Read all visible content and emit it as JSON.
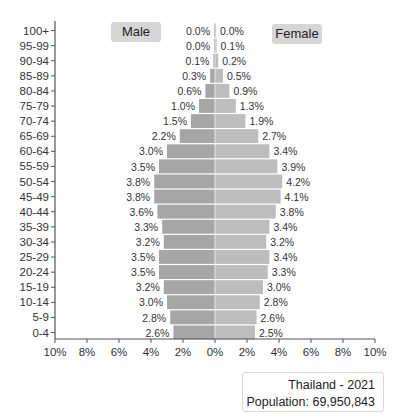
{
  "chart_data": {
    "type": "bar",
    "subtype": "population-pyramid",
    "title": "Thailand - 2021",
    "subtitle": "Population: 69,950,843",
    "categories": [
      "100+",
      "95-99",
      "90-94",
      "85-89",
      "80-84",
      "75-79",
      "70-74",
      "65-69",
      "60-64",
      "55-59",
      "50-54",
      "45-49",
      "40-44",
      "35-39",
      "30-34",
      "25-29",
      "20-24",
      "15-19",
      "10-14",
      "5-9",
      "0-4"
    ],
    "series": [
      {
        "name": "Male",
        "color": "#a6a6a6",
        "values": [
          0.0,
          0.0,
          0.1,
          0.3,
          0.6,
          1.0,
          1.5,
          2.2,
          3.0,
          3.5,
          3.8,
          3.8,
          3.6,
          3.3,
          3.2,
          3.5,
          3.5,
          3.2,
          3.0,
          2.8,
          2.6
        ]
      },
      {
        "name": "Female",
        "color": "#bdbdbd",
        "values": [
          0.0,
          0.1,
          0.2,
          0.5,
          0.9,
          1.3,
          1.9,
          2.7,
          3.4,
          3.9,
          4.2,
          4.1,
          3.8,
          3.4,
          3.2,
          3.4,
          3.3,
          3.0,
          2.8,
          2.6,
          2.5
        ]
      }
    ],
    "x_ticks": [
      "10%",
      "8%",
      "6%",
      "4%",
      "2%",
      "0%",
      "2%",
      "4%",
      "6%",
      "8%",
      "10%"
    ],
    "xlim": [
      -10,
      10
    ],
    "xlabel": "",
    "ylabel": "",
    "grid": false,
    "legend": [
      "Male",
      "Female"
    ],
    "legend_position": "top"
  },
  "legend": {
    "male": "Male",
    "female": "Female"
  },
  "info": {
    "title": "Thailand - 2021",
    "population": "Population: 69,950,843"
  }
}
